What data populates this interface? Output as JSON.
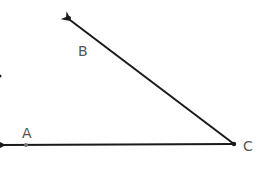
{
  "diagram": {
    "type": "angle",
    "vertex": {
      "label": "C",
      "x": 234,
      "y": 144
    },
    "rays": [
      {
        "name": "CA",
        "through": {
          "label": "A",
          "x": 26,
          "y": 145
        },
        "end": {
          "x": 2,
          "y": 145
        }
      },
      {
        "name": "CB",
        "through": {
          "label": "B",
          "x": 70,
          "y": 19
        },
        "end": {
          "x": 68,
          "y": 17
        }
      }
    ],
    "labels": {
      "a": "A",
      "b": "B",
      "c": "C"
    },
    "colors": {
      "line": "#1a1a1a",
      "label": "#555555",
      "point_a": "#777777"
    }
  }
}
